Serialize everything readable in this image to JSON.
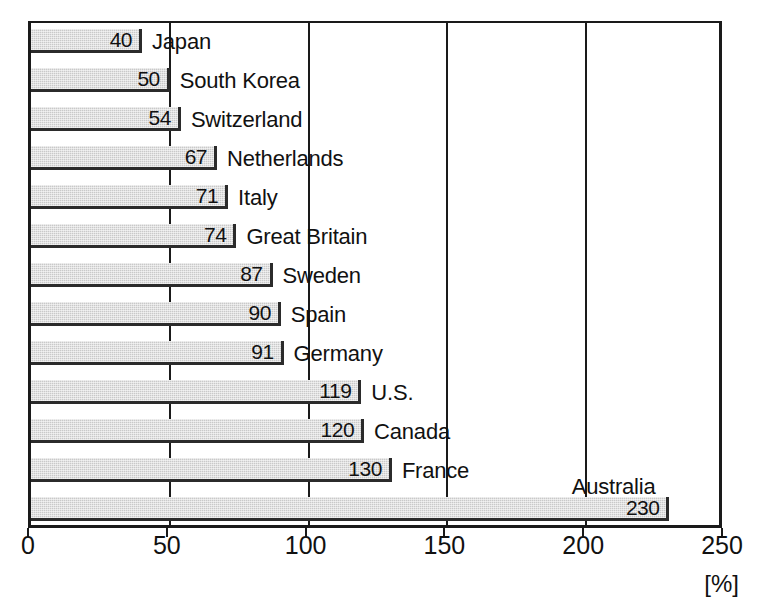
{
  "chart_data": {
    "type": "bar",
    "orientation": "horizontal",
    "title": "",
    "xlabel": "[%]",
    "ylabel": "",
    "xlim": [
      0,
      250
    ],
    "grid": true,
    "legend": false,
    "unit_label": "[%]",
    "xticks": [
      0,
      50,
      100,
      150,
      200,
      250
    ],
    "xtick_labels": [
      "0",
      "50",
      "100",
      "150",
      "200",
      "250"
    ],
    "gridlines": [
      50,
      100,
      150,
      200
    ],
    "categories": [
      "Japan",
      "South Korea",
      "Switzerland",
      "Netherlands",
      "Italy",
      "Great Britain",
      "Sweden",
      "Spain",
      "Germany",
      "U.S.",
      "Canada",
      "France",
      "Australia"
    ],
    "values": [
      40,
      50,
      54,
      67,
      71,
      74,
      87,
      90,
      91,
      119,
      120,
      130,
      230
    ],
    "value_labels": [
      "40",
      "50",
      "54",
      "67",
      "71",
      "74",
      "87",
      "90",
      "91",
      "119",
      "120",
      "130",
      "230"
    ],
    "bars": [
      {
        "label": "Japan",
        "value": 40,
        "value_label": "40",
        "label_position": "right"
      },
      {
        "label": "South Korea",
        "value": 50,
        "value_label": "50",
        "label_position": "right"
      },
      {
        "label": "Switzerland",
        "value": 54,
        "value_label": "54",
        "label_position": "right"
      },
      {
        "label": "Netherlands",
        "value": 67,
        "value_label": "67",
        "label_position": "right"
      },
      {
        "label": "Italy",
        "value": 71,
        "value_label": "71",
        "label_position": "right"
      },
      {
        "label": "Great Britain",
        "value": 74,
        "value_label": "74",
        "label_position": "right"
      },
      {
        "label": "Sweden",
        "value": 87,
        "value_label": "87",
        "label_position": "right"
      },
      {
        "label": "Spain",
        "value": 90,
        "value_label": "90",
        "label_position": "right"
      },
      {
        "label": "Germany",
        "value": 91,
        "value_label": "91",
        "label_position": "right"
      },
      {
        "label": "U.S.",
        "value": 119,
        "value_label": "119",
        "label_position": "right"
      },
      {
        "label": "Canada",
        "value": 120,
        "value_label": "120",
        "label_position": "right"
      },
      {
        "label": "France",
        "value": 130,
        "value_label": "130",
        "label_position": "right"
      },
      {
        "label": "Australia",
        "value": 230,
        "value_label": "230",
        "label_position": "above"
      }
    ],
    "colors": {
      "bar_fill": "#c9c9c9",
      "bar_edge": "#2b2b2b",
      "axis": "#1a1a1a",
      "text": "#111111",
      "background": "#ffffff"
    }
  }
}
